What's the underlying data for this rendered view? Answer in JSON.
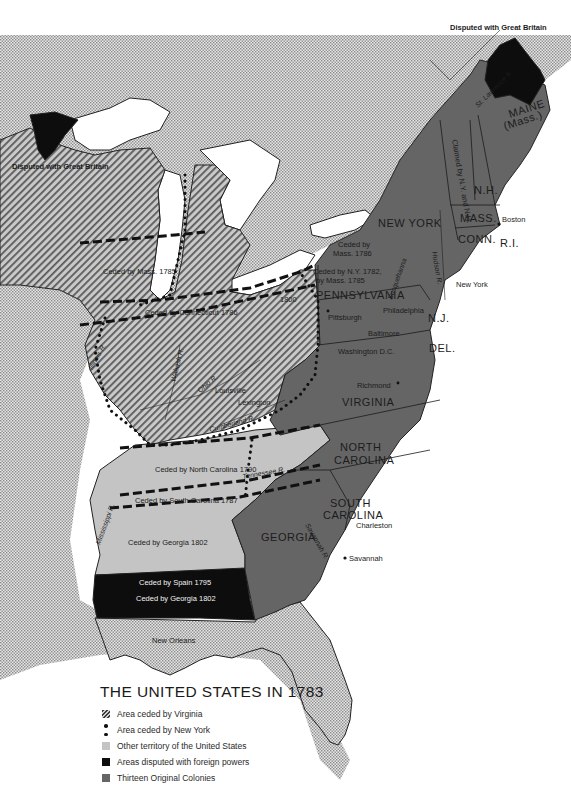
{
  "legend": {
    "title": "THE UNITED STATES IN 1783",
    "items": [
      {
        "key": "virginia-cession",
        "label": "Area ceded by Virginia",
        "swatch": "diagonal-hatch"
      },
      {
        "key": "newyork-cession",
        "label": "Area ceded by New York",
        "swatch": "dotted-border"
      },
      {
        "key": "other-territory",
        "label": "Other territory of the United States",
        "swatch": "#c4c4c4"
      },
      {
        "key": "disputed",
        "label": "Areas disputed with foreign powers",
        "swatch": "#0d0d0d"
      },
      {
        "key": "colonies",
        "label": "Thirteen Original Colonies",
        "swatch": "#656565"
      }
    ]
  },
  "colors": {
    "colonies": "#656565",
    "other_territory": "#c4c4c4",
    "disputed": "#0d0d0d",
    "foreign_dotted": "#dadada",
    "water": "#ffffff"
  },
  "states": {
    "maine": "MAINE",
    "maine_sub": "(Mass.)",
    "nh": "N.H.",
    "mass": "MASS.",
    "conn": "CONN.",
    "ri": "R.I.",
    "ny": "NEW YORK",
    "pa": "PENNSYLVANIA",
    "nj": "N.J.",
    "del": "DEL.",
    "va": "VIRGINIA",
    "nc1": "NORTH",
    "nc2": "CAROLINA",
    "sc1": "SOUTH",
    "sc2": "CAROLINA",
    "ga": "GEORGIA"
  },
  "labels": {
    "disputed_ne": "Disputed with Great Britain",
    "disputed_nw": "Disputed with Great Britain",
    "claimed_vt": "Claimed by N.Y. and N.H.",
    "ceded_mass_1785": "Ceded by Mass. 1785",
    "ceded_conn_1786": "Ceded by Connecticut 1786",
    "year_1800": "1800",
    "ceded_mass_1786_a": "Ceded by",
    "ceded_mass_1786_b": "Mass. 1786",
    "ceded_ny_1782_a": "Ceded by N.Y. 1782,",
    "ceded_ny_1782_b": "by Mass. 1785",
    "ceded_nc_1790": "Ceded by North Carolina 1790",
    "ceded_sc_1787": "Ceded by South Carolina 1787",
    "ceded_ga_1802": "Ceded by Georgia 1802",
    "ceded_spain_1795": "Ceded by Spain 1795",
    "ceded_ga_1802_b": "Ceded by Georgia 1802"
  },
  "cities": {
    "boston": "Boston",
    "new_york": "New York",
    "philadelphia": "Philadelphia",
    "pittsburgh": "Pittsburgh",
    "baltimore": "Baltimore",
    "washington": "Washington D.C.",
    "richmond": "Richmond",
    "louisville": "Louisville",
    "lexington": "Lexington",
    "charleston": "Charleston",
    "savannah": "Savannah",
    "new_orleans": "New Orleans"
  },
  "rivers": {
    "st_lawrence": "St. Lawrence R.",
    "hudson": "Hudson R.",
    "susquehanna": "Susquehanna",
    "illinois": "Illinois R.",
    "wabash": "Wabash R.",
    "ohio": "Ohio R.",
    "cumberland": "Cumberland R.",
    "tennessee": "Tennessee R.",
    "mississippi": "Mississippi R.",
    "savannah": "Savannah R."
  }
}
